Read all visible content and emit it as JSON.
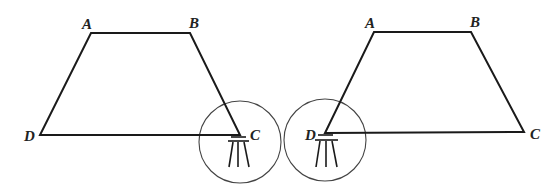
{
  "diagram": {
    "type": "geometry-trapezoid-survey",
    "figures": [
      {
        "id": "left",
        "vertices": {
          "A": {
            "label": "A",
            "x": 91,
            "y": 33
          },
          "B": {
            "label": "B",
            "x": 190,
            "y": 33
          },
          "C": {
            "label": "C",
            "x": 240,
            "y": 135
          },
          "D": {
            "label": "D",
            "x": 40,
            "y": 135
          }
        },
        "instrument_at": "C",
        "circle": {
          "cx": 240,
          "cy": 142,
          "r": 41
        }
      },
      {
        "id": "right",
        "vertices": {
          "A": {
            "label": "A",
            "x": 374,
            "y": 32
          },
          "B": {
            "label": "B",
            "x": 471,
            "y": 32
          },
          "C": {
            "label": "C",
            "x": 524,
            "y": 132
          },
          "D": {
            "label": "D",
            "x": 325,
            "y": 133
          }
        },
        "instrument_at": "D",
        "circle": {
          "cx": 325,
          "cy": 140,
          "r": 41
        }
      }
    ],
    "colors": {
      "line": "#1a1a1a",
      "circle": "#444444",
      "background": "#ffffff"
    }
  }
}
